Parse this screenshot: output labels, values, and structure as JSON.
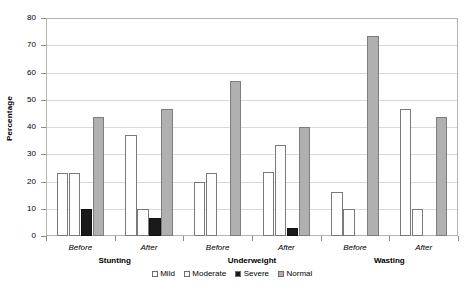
{
  "chart_data": {
    "type": "bar",
    "title": "",
    "xlabel": "",
    "ylabel": "Percentage",
    "ylim": [
      0,
      80
    ],
    "yticks": [
      0,
      10,
      20,
      30,
      40,
      50,
      60,
      70,
      80
    ],
    "grid": true,
    "legend_position": "bottom-center",
    "categories": [
      "Before",
      "After",
      "Before",
      "After",
      "Before",
      "After"
    ],
    "groups": [
      {
        "name": "Stunting",
        "categories": [
          "Before",
          "After"
        ]
      },
      {
        "name": "Underweight",
        "categories": [
          "Before",
          "After"
        ]
      },
      {
        "name": "Wasting",
        "categories": [
          "Before",
          "After"
        ]
      }
    ],
    "series": [
      {
        "name": "Mild",
        "color": "#ffffff",
        "values": [
          23,
          37,
          20,
          23.5,
          16,
          46.5
        ]
      },
      {
        "name": "Moderate",
        "color": "#fdfdfd",
        "values": [
          23,
          10,
          23,
          33.5,
          10,
          10
        ]
      },
      {
        "name": "Severe",
        "color": "#1a1a1a",
        "values": [
          10,
          6.5,
          0,
          3,
          0,
          0
        ]
      },
      {
        "name": "Normal",
        "color": "#b0b0b0",
        "values": [
          43.5,
          46.5,
          57,
          40,
          73.5,
          43.5
        ]
      }
    ]
  },
  "axis": {
    "y_title": "Percentage",
    "y_tick_labels": [
      "80",
      "70",
      "60",
      "50",
      "40",
      "30",
      "20",
      "10",
      "0"
    ]
  },
  "legend": {
    "items": [
      {
        "label": "Mild"
      },
      {
        "label": "Moderate"
      },
      {
        "label": "Severe"
      },
      {
        "label": "Normal"
      }
    ]
  }
}
